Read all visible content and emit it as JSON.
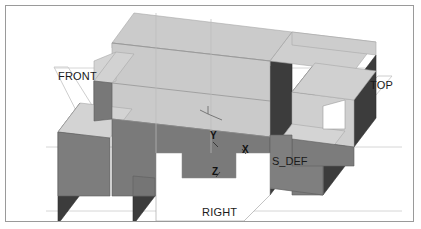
{
  "viewport": {
    "background_color": "#ffffff",
    "border_color": "#9a9a9a",
    "width": 421,
    "height": 229
  },
  "view_labels": {
    "front": "FRONT",
    "top": "TOP",
    "right": "RIGHT"
  },
  "axes": {
    "x": "X",
    "y": "Y",
    "z": "Z"
  },
  "datum": {
    "label": "S_DEF"
  },
  "model": {
    "shading": {
      "top_face_color": "#c9c9c9",
      "top_face_light_color": "#d2d2d2",
      "front_face_color": "#797979",
      "side_face_color": "#3c3c3c",
      "edge_color": "#8f8f8f",
      "wire_color": "#bdbdbd"
    }
  }
}
